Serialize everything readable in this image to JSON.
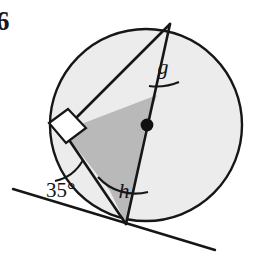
{
  "figure": {
    "question_number": "6",
    "canvas": {
      "width": 258,
      "height": 262,
      "background": "#ffffff"
    },
    "colors": {
      "ink": "#161616",
      "circle_fill": "#ececec",
      "quad_fill": "#b9b9b9",
      "white_fill": "#ffffff",
      "dot": "#111111"
    },
    "circle": {
      "label": "circle",
      "cx": 146,
      "cy": 125,
      "r": 96,
      "fill": "#ececec",
      "stroke": "#161616",
      "stroke_width": 2.4
    },
    "center_dot": {
      "label": "centre point",
      "cx": 147,
      "cy": 125,
      "r": 6.2,
      "fill": "#111111"
    },
    "points": {
      "apex": {
        "name": "A",
        "x": 170,
        "y": 24
      },
      "tangent_point": {
        "name": "B",
        "x": 126,
        "y": 224
      },
      "left_vertex": {
        "name": "C",
        "x": 63,
        "y": 131
      },
      "quad_upper": {
        "name": "D",
        "x": 157,
        "y": 95
      },
      "quad_lower": {
        "name": "E",
        "x": 110,
        "y": 191
      },
      "tangent_left_end": {
        "x": 13,
        "y": 189
      },
      "tangent_right_end": {
        "x": 215,
        "y": 250
      }
    },
    "shaded_quadrilateral": {
      "label": "shaded quadrilateral",
      "points": "157,95 63,131 110,191 126,224 146,125",
      "fill": "#b9b9b9",
      "stroke": "#161616",
      "stroke_width": 2.2
    },
    "segments": [
      {
        "name": "diameter-apex-to-tangent-point",
        "x1": 170,
        "y1": 24,
        "x2": 126,
        "y2": 224
      },
      {
        "name": "chord-apex-to-left-vertex",
        "x1": 170,
        "y1": 24,
        "x2": 63,
        "y2": 131
      },
      {
        "name": "chord-left-vertex-to-tangent-point",
        "x1": 63,
        "y1": 131,
        "x2": 126,
        "y2": 224
      },
      {
        "name": "tangent-line",
        "x1": 13,
        "y1": 189,
        "x2": 215,
        "y2": 250
      }
    ],
    "right_angle_marker": {
      "label": "right angle square at left vertex",
      "points": "50,124 68,110 85,128 66,142",
      "fill": "#ffffff",
      "stroke": "#161616"
    },
    "angle_arcs": [
      {
        "name": "arc-angle-g",
        "d": "M 151 85 A 56 56 0 0 0 178 83"
      },
      {
        "name": "arc-angle-h",
        "d": "M 99 179 A 48 48 0 0 0 146 193"
      },
      {
        "name": "arc-angle-35",
        "d": "M 58 183 A 38 38 0 0 0 81 163"
      }
    ],
    "labels": {
      "angle_g": {
        "text": "g",
        "x": 163,
        "y": 74,
        "size": 22
      },
      "angle_h": {
        "text": "h",
        "x": 124,
        "y": 196,
        "size": 22
      },
      "angle_35": {
        "text": "35°",
        "x": 46,
        "y": 196,
        "size": 21
      },
      "question_number": {
        "text": "6",
        "x": -3,
        "y": 28,
        "size": 26
      }
    }
  }
}
